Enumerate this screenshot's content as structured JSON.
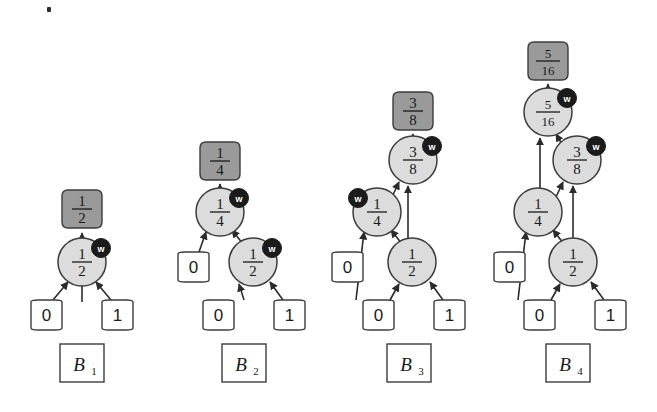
{
  "figure": {
    "background_color": "#ffffff",
    "node_fill": "#dcdcdc",
    "node_stroke": "#3c3c3c",
    "output_fill": "#9a9a9a",
    "output_stroke": "#3c3c3c",
    "input_fill": "#ffffff",
    "input_stroke": "#3c3c3c",
    "badge_fill": "#1b1b1b",
    "badge_text_color": "#ffffff",
    "edge_color": "#2b2b2b"
  },
  "badge": {
    "label": "w",
    "name": "w-badge"
  },
  "groups": [
    {
      "id": "B1",
      "label": "B",
      "label_sub": "1",
      "output": {
        "num": "1",
        "den": "2"
      },
      "circles": [
        {
          "id": "b1-c1",
          "num": "1",
          "den": "2",
          "badge": "w",
          "badge_side": "right"
        }
      ],
      "inputs": [
        {
          "id": "b1-in0",
          "value": "0"
        },
        {
          "id": "b1-in1",
          "value": "1"
        }
      ]
    },
    {
      "id": "B2",
      "label": "B",
      "label_sub": "2",
      "output": {
        "num": "1",
        "den": "4"
      },
      "circles": [
        {
          "id": "b2-c1",
          "num": "1",
          "den": "4",
          "badge": "w",
          "badge_side": "right"
        },
        {
          "id": "b2-c2",
          "num": "1",
          "den": "2",
          "badge": "w",
          "badge_side": "right"
        }
      ],
      "inputs": [
        {
          "id": "b2-in0a",
          "value": "0"
        },
        {
          "id": "b2-in0b",
          "value": "0"
        },
        {
          "id": "b2-in1",
          "value": "1"
        }
      ]
    },
    {
      "id": "B3",
      "label": "B",
      "label_sub": "3",
      "output": {
        "num": "3",
        "den": "8"
      },
      "circles": [
        {
          "id": "b3-c1",
          "num": "3",
          "den": "8",
          "badge": "w",
          "badge_side": "right"
        },
        {
          "id": "b3-c2",
          "num": "1",
          "den": "4",
          "badge": "w",
          "badge_side": "left"
        },
        {
          "id": "b3-c3",
          "num": "1",
          "den": "2",
          "badge": null,
          "badge_side": null
        }
      ],
      "inputs": [
        {
          "id": "b3-in0a",
          "value": "0"
        },
        {
          "id": "b3-in0b",
          "value": "0"
        },
        {
          "id": "b3-in1",
          "value": "1"
        }
      ]
    },
    {
      "id": "B4",
      "label": "B",
      "label_sub": "4",
      "output": {
        "num": "5",
        "den": "16"
      },
      "circles": [
        {
          "id": "b4-c1",
          "num": "5",
          "den": "16",
          "badge": "w",
          "badge_side": "right"
        },
        {
          "id": "b4-c2",
          "num": "3",
          "den": "8",
          "badge": "w",
          "badge_side": "right"
        },
        {
          "id": "b4-c3",
          "num": "1",
          "den": "4",
          "badge": null,
          "badge_side": null
        },
        {
          "id": "b4-c4",
          "num": "1",
          "den": "2",
          "badge": null,
          "badge_side": null
        }
      ],
      "inputs": [
        {
          "id": "b4-in0a",
          "value": "0"
        },
        {
          "id": "b4-in0b",
          "value": "0"
        },
        {
          "id": "b4-in1",
          "value": "1"
        }
      ]
    }
  ]
}
